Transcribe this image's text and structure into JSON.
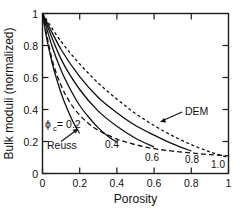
{
  "chart_data": {
    "type": "line",
    "title": "",
    "xlabel": "Porosity",
    "ylabel": "Bulk moduli (normalized)",
    "xlim": [
      0,
      1
    ],
    "ylim": [
      0,
      1
    ],
    "xticks": [
      "0",
      "0.2",
      "0.4",
      "0.6",
      "0.8",
      "1"
    ],
    "xtick_values": [
      0,
      0.2,
      0.4,
      0.6,
      0.8,
      1
    ],
    "yticks": [
      "0",
      "0.2",
      "0.4",
      "0.6",
      "0.8",
      "1"
    ],
    "ytick_values": [
      0,
      0.2,
      0.4,
      0.6,
      0.8,
      1
    ],
    "grid": false,
    "legend_position": "none",
    "series": [
      {
        "name": "Reuss",
        "style": "dashed",
        "label": "Reuss",
        "x": [
          0,
          0.05,
          0.1,
          0.15,
          0.2,
          0.25,
          0.3,
          0.4,
          0.5,
          0.6,
          0.7,
          0.8,
          0.9,
          1.0
        ],
        "y": [
          1.0,
          0.72,
          0.55,
          0.44,
          0.365,
          0.31,
          0.27,
          0.215,
          0.18,
          0.155,
          0.14,
          0.128,
          0.118,
          0.11
        ]
      },
      {
        "name": "phi_c = 0.2",
        "style": "solid",
        "label": "0.2",
        "x": [
          0,
          0.02,
          0.05,
          0.08,
          0.11,
          0.14,
          0.17,
          0.2
        ],
        "y": [
          1.0,
          0.86,
          0.7,
          0.575,
          0.47,
          0.385,
          0.31,
          0.25
        ]
      },
      {
        "name": "phi_c = 0.4",
        "style": "solid",
        "label": "0.4",
        "x": [
          0,
          0.05,
          0.1,
          0.15,
          0.2,
          0.25,
          0.3,
          0.35,
          0.4
        ],
        "y": [
          1.0,
          0.8,
          0.645,
          0.525,
          0.425,
          0.35,
          0.285,
          0.235,
          0.195
        ]
      },
      {
        "name": "phi_c = 0.6",
        "style": "solid",
        "label": "0.6",
        "x": [
          0,
          0.1,
          0.2,
          0.3,
          0.4,
          0.5,
          0.6
        ],
        "y": [
          1.0,
          0.715,
          0.525,
          0.39,
          0.295,
          0.22,
          0.165
        ]
      },
      {
        "name": "phi_c = 0.8",
        "style": "solid",
        "label": "0.8",
        "x": [
          0,
          0.1,
          0.2,
          0.3,
          0.4,
          0.5,
          0.6,
          0.7,
          0.8
        ],
        "y": [
          1.0,
          0.775,
          0.605,
          0.475,
          0.38,
          0.3,
          0.24,
          0.185,
          0.14
        ]
      },
      {
        "name": "DEM",
        "style": "dotted",
        "label": "1.0",
        "annotation": "DEM",
        "x": [
          0,
          0.1,
          0.2,
          0.3,
          0.4,
          0.5,
          0.6,
          0.7,
          0.8,
          0.9,
          1.0
        ],
        "y": [
          1.0,
          0.825,
          0.685,
          0.565,
          0.465,
          0.375,
          0.3,
          0.235,
          0.18,
          0.135,
          0.1
        ]
      }
    ],
    "annotations": [
      {
        "name": "phi-c-label",
        "text": "ϕ",
        "sub": "c",
        "rest": "= 0.2"
      },
      {
        "name": "reuss-label",
        "text": "Reuss"
      },
      {
        "name": "dem-label",
        "text": "DEM"
      }
    ],
    "curve_end_labels": [
      {
        "name": "label-0-4",
        "text": "0.4"
      },
      {
        "name": "label-0-6",
        "text": "0.6"
      },
      {
        "name": "label-0-8",
        "text": "0.8"
      },
      {
        "name": "label-1-0",
        "text": "1.0"
      }
    ]
  }
}
